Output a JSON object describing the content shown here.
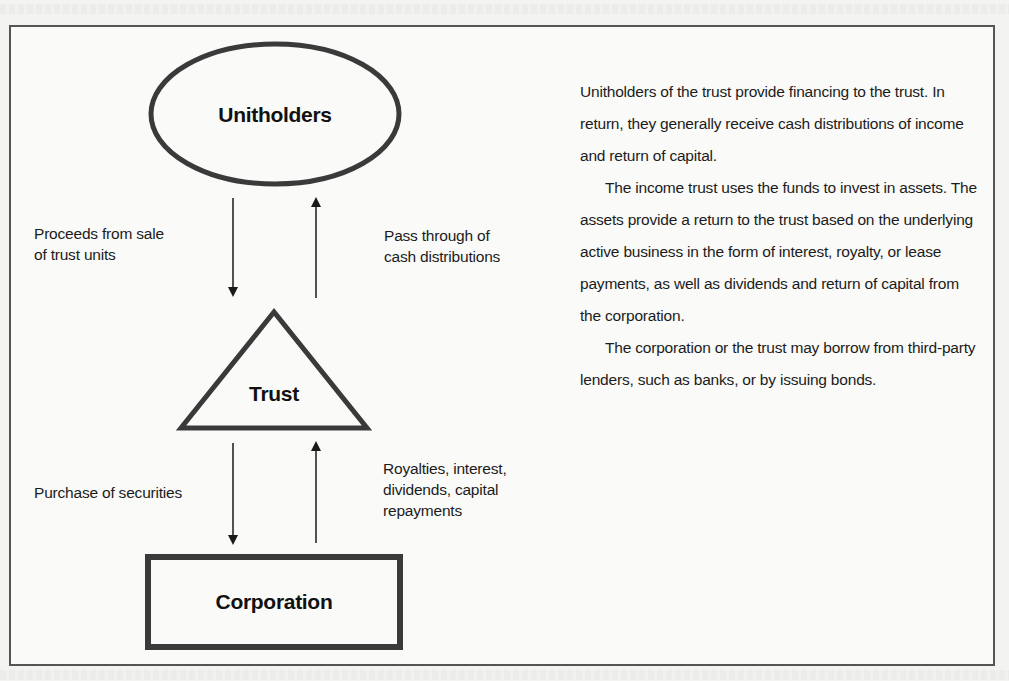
{
  "diagram": {
    "nodes": {
      "unitholders": {
        "label": "Unitholders",
        "shape": "ellipse"
      },
      "trust": {
        "label": "Trust",
        "shape": "triangle"
      },
      "corporation": {
        "label": "Corporation",
        "shape": "rectangle"
      }
    },
    "edges": [
      {
        "from": "unitholders",
        "to": "trust",
        "label_line1": "Proceeds from sale",
        "label_line2": "of trust units"
      },
      {
        "from": "trust",
        "to": "unitholders",
        "label_line1": "Pass through of",
        "label_line2": "cash distributions"
      },
      {
        "from": "trust",
        "to": "corporation",
        "label": "Purchase of securities"
      },
      {
        "from": "corporation",
        "to": "trust",
        "label_line1": "Royalties, interest,",
        "label_line2": "dividends, capital",
        "label_line3": "repayments"
      }
    ]
  },
  "description": {
    "paragraphs": [
      "Unitholders of the trust provide financing to the trust. In return, they generally receive cash distributions of income and return of capital.",
      "The income trust uses the funds to invest in assets. The assets provide a return to the trust based on the underlying active business in the form of interest, royalty, or lease payments, as well as dividends and return of capital from the corporation.",
      "The corporation or the trust may borrow from third-party lenders, such as banks, or by issuing bonds."
    ]
  },
  "colors": {
    "stroke": "#3a3a3a",
    "text": "#1a1a1a",
    "background": "#fafaf8"
  }
}
